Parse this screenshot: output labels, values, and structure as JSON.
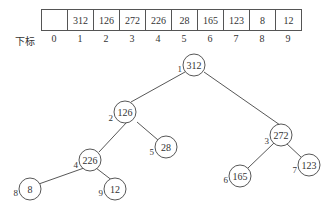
{
  "array": {
    "label": "下标",
    "cells": [
      "",
      "312",
      "126",
      "272",
      "226",
      "28",
      "165",
      "123",
      "8",
      "12"
    ],
    "indices": [
      "0",
      "1",
      "2",
      "3",
      "4",
      "5",
      "6",
      "7",
      "8",
      "9"
    ]
  },
  "tree": {
    "nodes": [
      {
        "index": "1",
        "value": "312"
      },
      {
        "index": "2",
        "value": "126"
      },
      {
        "index": "3",
        "value": "272"
      },
      {
        "index": "4",
        "value": "226"
      },
      {
        "index": "5",
        "value": "28"
      },
      {
        "index": "6",
        "value": "165"
      },
      {
        "index": "7",
        "value": "123"
      },
      {
        "index": "8",
        "value": "8"
      },
      {
        "index": "9",
        "value": "12"
      }
    ]
  }
}
